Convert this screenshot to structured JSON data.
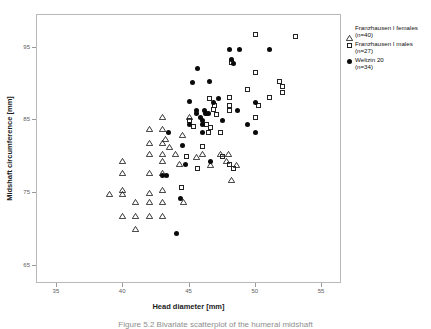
{
  "figure": {
    "caption": "Figure 5.2  Bivariate scatterplot of the humeral midshaft"
  },
  "axes": {
    "xlabel": "Head diameter [mm]",
    "ylabel": "Midshaft circumference [mm]",
    "xticks": [
      "35",
      "40",
      "45",
      "50",
      "55"
    ],
    "yticks": [
      "95",
      "85",
      "75",
      "65"
    ]
  },
  "legend": {
    "items": [
      {
        "marker": "triangle-open",
        "name": "Franzhausen I  females",
        "count": "(n=40)"
      },
      {
        "marker": "square-open",
        "name": "Franzhausen I males",
        "count": "(n=27)"
      },
      {
        "marker": "circle-filled",
        "name": "Weltzin 20",
        "count": "(n=34)"
      }
    ]
  },
  "chart_data": {
    "type": "scatter",
    "title": "",
    "xlabel": "Head diameter [mm]",
    "ylabel": "Midshaft circumference [mm]",
    "xlim": [
      33.5,
      56.5
    ],
    "ylim": [
      62.5,
      99.5
    ],
    "xticks": [
      35,
      40,
      45,
      50,
      55
    ],
    "yticks": [
      95,
      85,
      75,
      65
    ],
    "grid": false,
    "legend_position": "right-outside",
    "series": [
      {
        "name": "Franzhausen I  females",
        "count": 40,
        "marker": "triangle-open",
        "color": "#232323",
        "points": [
          [
            39.0,
            74.4
          ],
          [
            40.0,
            79.0
          ],
          [
            40.0,
            77.4
          ],
          [
            40.0,
            75.0
          ],
          [
            40.0,
            74.4
          ],
          [
            40.0,
            71.5
          ],
          [
            41.0,
            73.4
          ],
          [
            41.0,
            71.5
          ],
          [
            41.0,
            69.6
          ],
          [
            42.0,
            83.4
          ],
          [
            42.0,
            81.5
          ],
          [
            42.0,
            80.0
          ],
          [
            42.0,
            77.4
          ],
          [
            42.0,
            74.6
          ],
          [
            42.0,
            73.4
          ],
          [
            42.0,
            71.5
          ],
          [
            43.0,
            85.0
          ],
          [
            43.0,
            83.4
          ],
          [
            43.0,
            81.5
          ],
          [
            43.0,
            80.0
          ],
          [
            43.0,
            79.0
          ],
          [
            43.0,
            77.4
          ],
          [
            43.0,
            75.0
          ],
          [
            43.0,
            73.4
          ],
          [
            43.0,
            71.5
          ],
          [
            43.2,
            82.1
          ],
          [
            43.5,
            81.0
          ],
          [
            44.0,
            80.0
          ],
          [
            44.3,
            78.6
          ],
          [
            44.5,
            82.6
          ],
          [
            44.6,
            73.4
          ],
          [
            45.0,
            85.0
          ],
          [
            45.6,
            79.6
          ],
          [
            46.0,
            80.0
          ],
          [
            46.6,
            78.4
          ],
          [
            47.4,
            80.0
          ],
          [
            47.8,
            79.0
          ],
          [
            48.0,
            80.0
          ],
          [
            48.2,
            76.4
          ],
          [
            48.6,
            78.4
          ]
        ]
      },
      {
        "name": "Franzhausen I males",
        "count": 27,
        "marker": "square-open",
        "color": "#232323",
        "points": [
          [
            44.4,
            75.8
          ],
          [
            44.8,
            80.0
          ],
          [
            45.0,
            85.0
          ],
          [
            45.3,
            84.2
          ],
          [
            45.6,
            78.4
          ],
          [
            46.0,
            81.4
          ],
          [
            46.3,
            84.5
          ],
          [
            46.4,
            83.4
          ],
          [
            46.5,
            88.0
          ],
          [
            46.6,
            84.0
          ],
          [
            46.8,
            86.5
          ],
          [
            46.9,
            87.1
          ],
          [
            47.0,
            85.8
          ],
          [
            47.3,
            83.4
          ],
          [
            47.5,
            80.0
          ],
          [
            48.0,
            88.1
          ],
          [
            48.0,
            87.0
          ],
          [
            48.0,
            86.3
          ],
          [
            48.0,
            79.0
          ],
          [
            48.3,
            78.4
          ],
          [
            48.2,
            93.0
          ],
          [
            49.4,
            89.2
          ],
          [
            50.0,
            91.6
          ],
          [
            50.0,
            85.4
          ],
          [
            50.2,
            87.0
          ],
          [
            51.0,
            88.1
          ],
          [
            51.8,
            90.4
          ],
          [
            52.0,
            89.6
          ],
          [
            52.0,
            88.8
          ],
          [
            53.0,
            96.6
          ],
          [
            50.0,
            96.8
          ]
        ]
      },
      {
        "name": "Weltzin 20",
        "count": 34,
        "marker": "circle-filled",
        "color": "#0a0a0a",
        "points": [
          [
            43.0,
            77.4
          ],
          [
            43.3,
            77.4
          ],
          [
            43.4,
            83.4
          ],
          [
            44.0,
            69.5
          ],
          [
            44.3,
            74.3
          ],
          [
            44.5,
            81.5
          ],
          [
            44.7,
            79.0
          ],
          [
            45.0,
            84.4
          ],
          [
            45.0,
            87.6
          ],
          [
            45.2,
            90.2
          ],
          [
            45.5,
            86.4
          ],
          [
            45.5,
            85.9
          ],
          [
            45.6,
            92.1
          ],
          [
            45.8,
            85.4
          ],
          [
            46.0,
            83.4
          ],
          [
            46.0,
            85.0
          ],
          [
            46.0,
            84.4
          ],
          [
            46.1,
            86.3
          ],
          [
            46.2,
            86.0
          ],
          [
            46.3,
            86.0
          ],
          [
            46.4,
            86.0
          ],
          [
            46.5,
            90.4
          ],
          [
            46.6,
            79.4
          ],
          [
            46.8,
            87.5
          ],
          [
            47.2,
            88.0
          ],
          [
            47.5,
            85.0
          ],
          [
            48.0,
            94.7
          ],
          [
            48.2,
            93.4
          ],
          [
            48.3,
            92.8
          ],
          [
            48.6,
            86.3
          ],
          [
            48.8,
            94.7
          ],
          [
            49.4,
            84.4
          ],
          [
            50.0,
            87.5
          ],
          [
            50.0,
            83.4
          ],
          [
            51.0,
            94.7
          ]
        ]
      }
    ]
  }
}
